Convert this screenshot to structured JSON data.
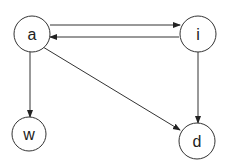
{
  "diagram": {
    "type": "directed-graph",
    "nodes": [
      {
        "id": "a",
        "label": "a",
        "cx": 32,
        "cy": 34,
        "r": 18
      },
      {
        "id": "i",
        "label": "i",
        "cx": 198,
        "cy": 34,
        "r": 18
      },
      {
        "id": "w",
        "label": "w",
        "cx": 29,
        "cy": 134,
        "r": 17
      },
      {
        "id": "d",
        "label": "d",
        "cx": 197,
        "cy": 141,
        "r": 18
      }
    ],
    "edges": [
      {
        "from": "a",
        "to": "i",
        "x1": 50,
        "y1": 25,
        "x2": 180,
        "y2": 25
      },
      {
        "from": "i",
        "to": "a",
        "x1": 179,
        "y1": 37,
        "x2": 50,
        "y2": 37
      },
      {
        "from": "a",
        "to": "w",
        "x1": 30,
        "y1": 52,
        "x2": 30,
        "y2": 117
      },
      {
        "from": "a",
        "to": "d",
        "x1": 43,
        "y1": 47,
        "x2": 180,
        "y2": 130
      },
      {
        "from": "i",
        "to": "d",
        "x1": 198,
        "y1": 52,
        "x2": 198,
        "y2": 123
      }
    ],
    "colors": {
      "stroke": "#333333",
      "node_fill": "#ffffff",
      "background": "#ffffff"
    }
  }
}
